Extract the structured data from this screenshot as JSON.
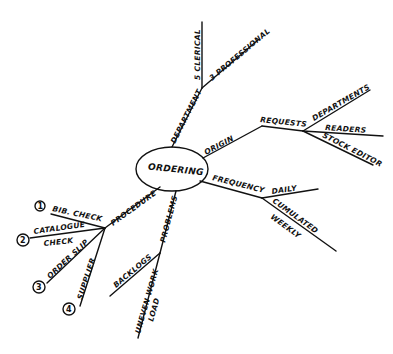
{
  "diagram": {
    "type": "mind-map",
    "style": "hand-drawn",
    "center": {
      "label": "ORDERING"
    },
    "branches": [
      {
        "label": "DEPARTMENT",
        "children": [
          {
            "label": "5 CLERICAL"
          },
          {
            "label": "3 PROFESSIONAL"
          }
        ]
      },
      {
        "label": "ORIGIN",
        "children": [
          {
            "label": "REQUESTS",
            "children": [
              {
                "label": "DEPARTMENTS"
              },
              {
                "label": "READERS"
              },
              {
                "label": "STOCK EDITOR"
              }
            ]
          }
        ]
      },
      {
        "label": "FREQUENCY",
        "children": [
          {
            "label": "DAILY"
          },
          {
            "label": "CUMULATED WEEKLY"
          }
        ]
      },
      {
        "label": "PROBLEMS",
        "children": [
          {
            "label": "BACKLOGS"
          },
          {
            "label": "UNEVEN WORK LOAD"
          }
        ]
      },
      {
        "label": "PROCEDURE",
        "children": [
          {
            "number": "1",
            "label": "BIB. CHECK"
          },
          {
            "number": "2",
            "label": "CATALOGUE CHECK"
          },
          {
            "number": "3",
            "label": "ORDER SLIP"
          },
          {
            "number": "4",
            "label": "SUPPLIER"
          }
        ]
      }
    ]
  },
  "text": {
    "center": "ORDERING",
    "department": "DEPARTMENT",
    "clerical": "5 CLERICAL",
    "professional": "3 PROFESSIONAL",
    "origin": "ORIGIN",
    "requests": "REQUESTS",
    "departments": "DEPARTMENTS",
    "readers": "READERS",
    "stock_editor": "STOCK EDITOR",
    "frequency": "FREQUENCY",
    "daily": "DAILY",
    "cumulated": "CUMULATED",
    "weekly": "WEEKLY",
    "problems": "PROBLEMS",
    "backlogs": "BACKLOGS",
    "uneven_work": "UNEVEN WORK",
    "load": "LOAD",
    "procedure": "PROCEDURE",
    "bib_check": "BIB. CHECK",
    "catalogue": "CATALOGUE",
    "check": "CHECK",
    "order_slip": "ORDER SLIP",
    "supplier": "SUPPLIER",
    "n1": "1",
    "n2": "2",
    "n3": "3",
    "n4": "4"
  },
  "colors": {
    "ink": "#111111",
    "paper": "#ffffff"
  }
}
